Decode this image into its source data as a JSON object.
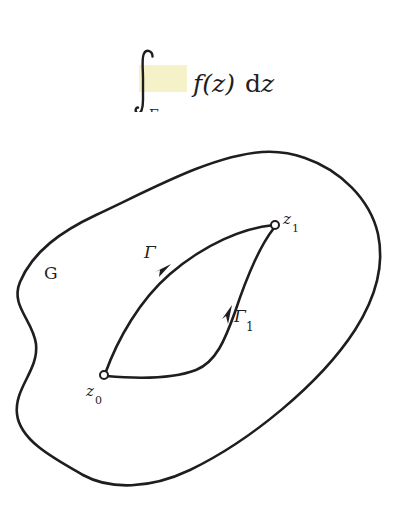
{
  "page": {
    "background_color": "#ffffff",
    "ink_color": "#1f1d1d",
    "highlight_color": "#f5f1c8",
    "width": 401,
    "height": 511
  },
  "formula": {
    "description": "contour integral of f of z d z along Gamma",
    "integral_sign": "∫",
    "lower_limit": "Γ",
    "integrand": "f(z)",
    "differential_d": "d",
    "differential_var": "z",
    "highlighted": true,
    "highlight_color": "#f5f1c8"
  },
  "diagram": {
    "type": "complex-plane-contour-diagram",
    "region_label": "G",
    "labels": [
      {
        "name": "region-label-g",
        "text": "G",
        "x": 44,
        "y": 279,
        "size": 17,
        "style": "upright"
      },
      {
        "name": "curve-label-gamma",
        "text": "Γ",
        "x": 144,
        "y": 258,
        "size": 17,
        "style": "italic"
      },
      {
        "name": "curve-label-gamma-one-base",
        "text": "Γ",
        "x": 234,
        "y": 322,
        "size": 17,
        "style": "italic"
      },
      {
        "name": "curve-label-gamma-one-sub",
        "text": "1",
        "x": 247,
        "y": 330,
        "size": 12,
        "style": "upright"
      },
      {
        "name": "point-label-z1-base",
        "text": "z",
        "x": 283,
        "y": 224,
        "size": 15,
        "style": "italic"
      },
      {
        "name": "point-label-z1-sub",
        "text": "1",
        "x": 293,
        "y": 231,
        "size": 11,
        "style": "upright"
      },
      {
        "name": "point-label-z0-base",
        "text": "z",
        "x": 86,
        "y": 396,
        "size": 15,
        "style": "italic"
      },
      {
        "name": "point-label-z0-sub",
        "text": "0",
        "x": 96,
        "y": 403,
        "size": 11,
        "style": "upright"
      }
    ],
    "points": [
      {
        "name": "point-z0",
        "label": "z₀",
        "cx": 104,
        "cy": 375,
        "r": 4
      },
      {
        "name": "point-z1",
        "label": "z₁",
        "cx": 275,
        "cy": 225,
        "r": 4
      }
    ],
    "curves": [
      {
        "name": "region-boundary-g",
        "label": "G",
        "closed": true,
        "path": "M 262 152 C 210 156, 150 190, 96 215 C 62 231, 33 251, 20 282 C 10 306, 33 320, 36 344 C 39 370, 14 388, 17 414 C 20 441, 55 459, 83 475 C 110 490, 150 489, 190 470 C 250 441, 320 384, 355 330 C 378 294, 384 262, 378 234 C 370 199, 340 170, 305 158 C 291 153, 276 151, 262 152 Z"
      },
      {
        "name": "curve-gamma",
        "label": "Γ",
        "closed": false,
        "path": "M 105 374 C 118 338, 140 300, 170 274 C 205 244, 243 228, 274 225",
        "arrow_at": {
          "x": 166,
          "y": 270,
          "angle": -52
        }
      },
      {
        "name": "curve-gamma-1",
        "label": "Γ₁",
        "closed": false,
        "path": "M 106 376 C 140 379, 175 378, 196 370 C 216 362, 225 340, 235 312 C 245 282, 258 248, 274 228",
        "arrow_at": {
          "x": 228,
          "y": 319,
          "angle": -71
        }
      }
    ]
  }
}
